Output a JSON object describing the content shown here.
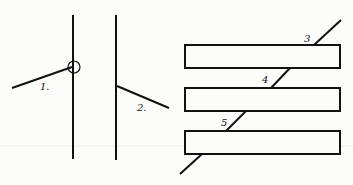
{
  "figure": {
    "left_panel": {
      "labels": [
        "1.",
        "2."
      ]
    },
    "right_panel": {
      "labels": [
        "3",
        "4",
        "5"
      ]
    },
    "colors": {
      "stroke": "#111111",
      "background": "#fcfcfb",
      "faint_rule": "#e6e6e6"
    }
  }
}
